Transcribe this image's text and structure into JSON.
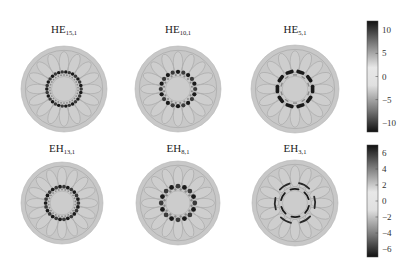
{
  "figure": {
    "rows": [
      {
        "name": "HE-modes",
        "panels": [
          {
            "family": "HE",
            "subscript": "15,1",
            "azimuthal_order": 15,
            "lobes": 30,
            "pattern": "dots"
          },
          {
            "family": "HE",
            "subscript": "10,1",
            "azimuthal_order": 10,
            "lobes": 20,
            "pattern": "dots"
          },
          {
            "family": "HE",
            "subscript": "5,1",
            "azimuthal_order": 5,
            "lobes": 10,
            "pattern": "dashes"
          }
        ],
        "colorbar": {
          "min": -12,
          "max": 12,
          "ticks": [
            10,
            5,
            0,
            -5,
            -10
          ],
          "tick_labels": [
            "10",
            "5",
            "0",
            "−5",
            "−10"
          ]
        }
      },
      {
        "name": "EH-modes",
        "panels": [
          {
            "family": "EH",
            "subscript": "13,1",
            "azimuthal_order": 13,
            "lobes": 26,
            "pattern": "dots"
          },
          {
            "family": "EH",
            "subscript": "8,1",
            "azimuthal_order": 8,
            "lobes": 16,
            "pattern": "dots"
          },
          {
            "family": "EH",
            "subscript": "3,1",
            "azimuthal_order": 3,
            "lobes": 6,
            "pattern": "arcs"
          }
        ],
        "colorbar": {
          "min": -7,
          "max": 7,
          "ticks": [
            6,
            4,
            2,
            0,
            -2,
            -4,
            -6
          ],
          "tick_labels": [
            "6",
            "4",
            "2",
            "0",
            "−2",
            "−4",
            "−6"
          ]
        }
      }
    ],
    "fiber": {
      "petal_count": 16,
      "background_gray": "#c8c8c8",
      "outline_gray": "#9a9a9a"
    },
    "colormap": {
      "extreme": "#1a1a1a",
      "mid": "#e4e4e4",
      "low_mag": "#8a8a8a"
    }
  }
}
